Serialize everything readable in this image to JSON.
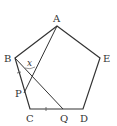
{
  "figure": {
    "shape": "regular pentagon ABCDE",
    "stroke_color": "#333333",
    "background": "#ffffff",
    "vertices": {
      "A": {
        "label": "A",
        "x": 57,
        "y": 26
      },
      "B": {
        "label": "B",
        "x": 15,
        "y": 58
      },
      "C": {
        "label": "C",
        "x": 30,
        "y": 109
      },
      "D": {
        "label": "D",
        "x": 83,
        "y": 109
      },
      "E": {
        "label": "E",
        "x": 100,
        "y": 58
      }
    },
    "points": {
      "P": {
        "label": "P",
        "x": 24,
        "y": 93,
        "on": "BC"
      },
      "Q": {
        "label": "Q",
        "x": 63,
        "y": 109,
        "on": "CD"
      }
    },
    "segments": [
      "AB",
      "BC",
      "CD",
      "DE",
      "EA",
      "AP",
      "BQ"
    ],
    "equal_marks": [
      "BP",
      "CQ"
    ],
    "angle_label": {
      "text": "x",
      "at": "intersection of AP and BQ"
    }
  }
}
